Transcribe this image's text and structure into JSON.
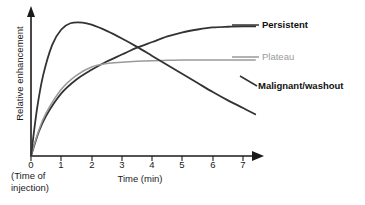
{
  "chart_data": {
    "type": "line",
    "title": "",
    "xlabel": "Time (min)",
    "ylabel": "Relative enhancement",
    "xlim": [
      0,
      7
    ],
    "ylim": [
      0,
      1
    ],
    "grid": false,
    "legend_position": "right-inline",
    "xticks": [
      "0",
      "1",
      "2",
      "3",
      "4",
      "5",
      "6",
      "7"
    ],
    "yticks": [],
    "annotations": [
      {
        "name": "injection-note",
        "line1": "(Time of",
        "line2": "injection)"
      }
    ],
    "series": [
      {
        "name": "Persistent",
        "label": "Persistent",
        "color": "#333333",
        "width": 1.8,
        "style": "bold-label",
        "x": [
          0,
          0.25,
          0.5,
          1.0,
          1.5,
          2.0,
          2.5,
          3.0,
          3.5,
          4.0,
          4.5,
          5.0,
          5.5,
          6.0,
          6.5,
          7.0,
          7.4
        ],
        "y": [
          0.0,
          0.17,
          0.29,
          0.45,
          0.55,
          0.62,
          0.68,
          0.73,
          0.78,
          0.82,
          0.86,
          0.89,
          0.91,
          0.925,
          0.93,
          0.932,
          0.932
        ]
      },
      {
        "name": "Plateau",
        "label": "Plateau",
        "color": "#9a9a9a",
        "width": 1.5,
        "style": "muted-label",
        "x": [
          0,
          0.25,
          0.5,
          1.0,
          1.5,
          2.0,
          2.5,
          3.0,
          3.5,
          4.0,
          4.5,
          5.0,
          5.5,
          6.0,
          6.5,
          7.0,
          7.4
        ],
        "y": [
          0.0,
          0.18,
          0.31,
          0.48,
          0.58,
          0.64,
          0.665,
          0.675,
          0.682,
          0.686,
          0.688,
          0.69,
          0.69,
          0.69,
          0.69,
          0.69,
          0.69
        ]
      },
      {
        "name": "Malignant/washout",
        "label": "Malignant/washout",
        "color": "#333333",
        "width": 1.8,
        "style": "bold-label",
        "x": [
          0,
          0.2,
          0.4,
          0.7,
          1.0,
          1.3,
          1.7,
          2.0,
          2.5,
          3.0,
          3.5,
          4.0,
          4.5,
          5.0,
          5.5,
          6.0,
          6.5,
          7.0,
          7.4
        ],
        "y": [
          0.0,
          0.34,
          0.58,
          0.8,
          0.91,
          0.955,
          0.96,
          0.945,
          0.9,
          0.845,
          0.785,
          0.72,
          0.655,
          0.59,
          0.525,
          0.46,
          0.4,
          0.345,
          0.3
        ]
      }
    ]
  },
  "legend": {
    "persistent": "Persistent",
    "plateau": "Plateau",
    "malignant": "Malignant/washout"
  },
  "axes": {
    "x_title": "Time (min)",
    "y_title": "Relative enhancement",
    "tick_0": "0",
    "tick_1": "1",
    "tick_2": "2",
    "tick_3": "3",
    "tick_4": "4",
    "tick_5": "5",
    "tick_6": "6",
    "tick_7": "7"
  },
  "notes": {
    "injection_line1": "(Time of",
    "injection_line2": "injection)"
  }
}
